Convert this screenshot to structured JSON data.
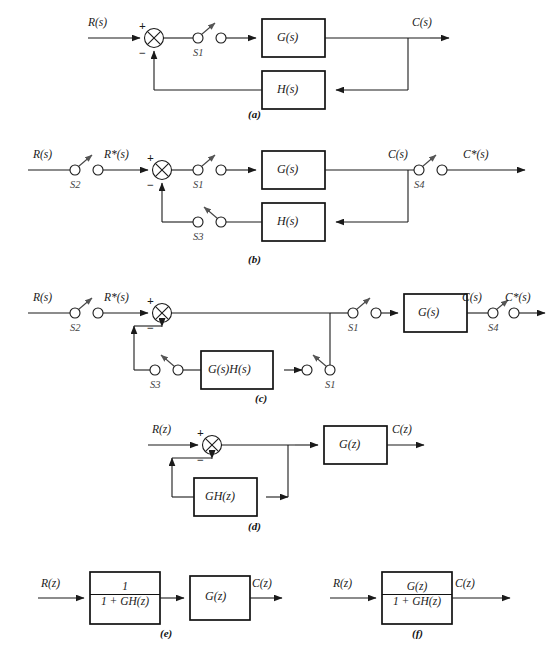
{
  "figure": {
    "type": "control-block-diagrams",
    "caption_prefix": "",
    "subfigures": [
      {
        "id": "a",
        "label": "(a)",
        "description": "Continuous closed-loop system with single sampler S1 in forward path",
        "signals": {
          "input": "R(s)",
          "output": "C(s)"
        },
        "blocks": [
          "G(s)",
          "H(s)"
        ],
        "switches": [
          "S1"
        ],
        "summing_signs": {
          "plus": "+",
          "minus": "−"
        }
      },
      {
        "id": "b",
        "label": "(b)",
        "description": "Sampled-data system with samplers S2, S1, S3, S4",
        "signals": {
          "input": "R(s)",
          "sampled_input": "R*(s)",
          "output": "C(s)",
          "sampled_output": "C*(s)"
        },
        "blocks": [
          "G(s)",
          "H(s)"
        ],
        "switches": [
          "S2",
          "S1",
          "S3",
          "S4"
        ],
        "summing_signs": {
          "plus": "+",
          "minus": "−"
        }
      },
      {
        "id": "c",
        "label": "(c)",
        "description": "Equivalent system with combined G(s)H(s) in feedback path",
        "signals": {
          "input": "R(s)",
          "sampled_input": "R*(s)",
          "output": "C(s)",
          "sampled_output": "C*(s)"
        },
        "blocks": [
          "G(s)H(s)",
          "G(s)"
        ],
        "switches": [
          "S2",
          "S1",
          "S3",
          "S1"
        ],
        "summing_signs": {
          "plus": "+",
          "minus": "−"
        }
      },
      {
        "id": "d",
        "label": "(d)",
        "description": "z-domain closed-loop block diagram",
        "signals": {
          "input": "R(z)",
          "output": "C(z)"
        },
        "blocks": [
          "G(z)",
          "GH(z)"
        ],
        "switches": [],
        "summing_signs": {
          "plus": "+",
          "minus": "−"
        }
      },
      {
        "id": "e",
        "label": "(e)",
        "description": "Open-loop equivalent: 1/(1+GH(z)) cascaded with G(z)",
        "signals": {
          "input": "R(z)",
          "output": "C(z)"
        },
        "blocks": [
          {
            "numerator": "1",
            "denominator": "1 + GH(z)"
          },
          {
            "numerator": "G(z)",
            "denominator": ""
          }
        ],
        "switches": []
      },
      {
        "id": "f",
        "label": "(f)",
        "description": "Single closed-loop transfer function block G(z)/(1+GH(z))",
        "signals": {
          "input": "R(z)",
          "output": "C(z)"
        },
        "blocks": [
          {
            "numerator": "G(z)",
            "denominator": "1 + GH(z)"
          }
        ],
        "switches": []
      }
    ]
  },
  "a": {
    "input_label": "R(s)",
    "output_label": "C(s)",
    "plus": "+",
    "minus": "−",
    "switch1": "S1",
    "block_g": "G(s)",
    "block_h": "H(s)",
    "caption": "(a)"
  },
  "b": {
    "input_label": "R(s)",
    "sampled_input_label": "R*(s)",
    "output_label": "C(s)",
    "sampled_output_label": "C*(s)",
    "plus": "+",
    "minus": "−",
    "switch2": "S2",
    "switch1": "S1",
    "switch3": "S3",
    "switch4": "S4",
    "block_g": "G(s)",
    "block_h": "H(s)",
    "caption": "(b)"
  },
  "c": {
    "input_label": "R(s)",
    "sampled_input_label": "R*(s)",
    "output_label": "C(s)",
    "sampled_output_label": "C*(s)",
    "plus": "+",
    "minus": "−",
    "switch2": "S2",
    "switch3": "S3",
    "switch1_fwd": "S1",
    "switch1_fb": "S1",
    "block_gh": "G(s)H(s)",
    "block_g": "G(s)",
    "caption": "(c)"
  },
  "d": {
    "input_label": "R(z)",
    "output_label": "C(z)",
    "plus": "+",
    "minus": "−",
    "block_g": "G(z)",
    "block_gh": "GH(z)",
    "caption": "(d)"
  },
  "e": {
    "input_label": "R(z)",
    "output_label": "C(z)",
    "block1_num": "1",
    "block1_den": "1 + GH(z)",
    "block2": "G(z)",
    "caption": "(e)"
  },
  "f": {
    "input_label": "R(z)",
    "output_label": "C(z)",
    "block_num": "G(z)",
    "block_den": "1 + GH(z)",
    "caption": "(f)"
  },
  "colors": {
    "line": "#1a1a1a",
    "block_border": "#111111",
    "background": "#ffffff",
    "switch_label": "#444444"
  }
}
